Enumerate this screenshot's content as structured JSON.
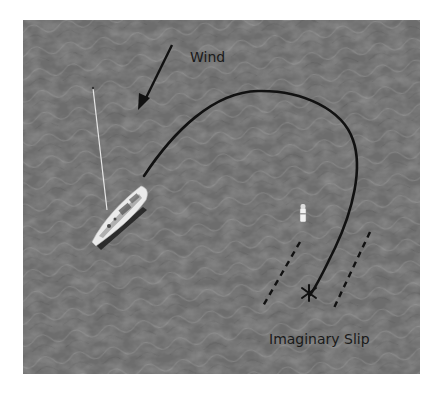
{
  "diagram": {
    "wind_label": "Wind",
    "slip_label": "Imaginary Slip",
    "background": "water-texture",
    "colors": {
      "water": "#6e6e6e",
      "water_light": "#9a9a9a",
      "water_dark": "#555555",
      "path": "#111111",
      "boat_hull": "#e8e8e8",
      "page_bg": "#ffffff"
    },
    "elements": [
      {
        "name": "wind-arrow",
        "direction": "down-left"
      },
      {
        "name": "sailboat",
        "description": "sailboat viewed from above with mast"
      },
      {
        "name": "course-path",
        "description": "curved path from boat looping around to slip"
      },
      {
        "name": "mooring-buoy",
        "description": "white buoy marker"
      },
      {
        "name": "slip-lines",
        "description": "two dashed parallel lines indicating slip"
      },
      {
        "name": "target-asterisk",
        "symbol": "*"
      }
    ]
  }
}
